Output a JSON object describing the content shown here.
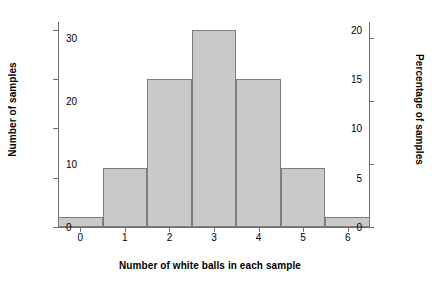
{
  "chart_data": {
    "type": "bar",
    "title": "",
    "xlabel": "Number of white balls in each sample",
    "ylabel": "Number of samples",
    "ylabel_secondary": "Percentage of samples",
    "categories": [
      "0",
      "1",
      "2",
      "3",
      "4",
      "5",
      "6"
    ],
    "values": [
      1,
      6,
      15,
      20,
      15,
      6,
      1
    ],
    "values_percentage": [
      1.6,
      9.4,
      23.4,
      31.3,
      23.4,
      9.4,
      1.6
    ],
    "ylim": [
      0,
      20.8
    ],
    "ylim_secondary": [
      0,
      32.5
    ],
    "yticks": [
      0,
      5,
      10,
      15,
      20
    ],
    "yticks_secondary": [
      0,
      10,
      20,
      30
    ],
    "xticks": [
      "0",
      "1",
      "2",
      "3",
      "4",
      "5",
      "6"
    ],
    "grid": false,
    "legend": "none",
    "bar_fill_color": "#c9c9c9",
    "bar_edge_color": "#7d7d7d",
    "axis_color": "#6e6e6e",
    "text_color": "#000000"
  },
  "axes": {
    "left_title": "Number of samples",
    "right_title": "Percentage of samples",
    "bottom_title": "Number of white balls in each sample"
  }
}
